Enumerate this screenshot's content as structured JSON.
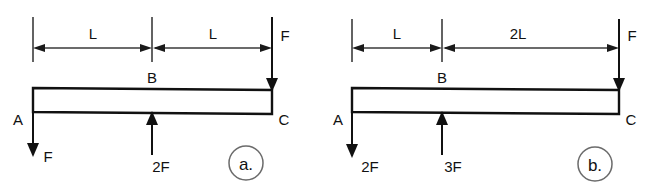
{
  "figure": {
    "background_color": "#ffffff",
    "line_color": "#111111",
    "dimension_color": "#3a3a3a",
    "caption_circle_color": "#6b6b6b"
  },
  "diagrams": [
    {
      "id": "a",
      "caption": "a.",
      "nodes": {
        "left": "A",
        "middle": "B",
        "right": "C"
      },
      "dimensions": [
        {
          "label": "L",
          "segment": "A-B"
        },
        {
          "label": "L",
          "segment": "B-C"
        }
      ],
      "forces": [
        {
          "label": "F",
          "location": "A",
          "direction": "down"
        },
        {
          "label": "2F",
          "location": "B",
          "direction": "up"
        },
        {
          "label": "F",
          "location": "C",
          "direction": "down"
        }
      ]
    },
    {
      "id": "b",
      "caption": "b.",
      "nodes": {
        "left": "A",
        "middle": "B",
        "right": "C"
      },
      "dimensions": [
        {
          "label": "L",
          "segment": "A-B"
        },
        {
          "label": "2L",
          "segment": "B-C"
        }
      ],
      "forces": [
        {
          "label": "2F",
          "location": "A",
          "direction": "down"
        },
        {
          "label": "3F",
          "location": "B",
          "direction": "up"
        },
        {
          "label": "F",
          "location": "C",
          "direction": "down"
        }
      ]
    }
  ]
}
